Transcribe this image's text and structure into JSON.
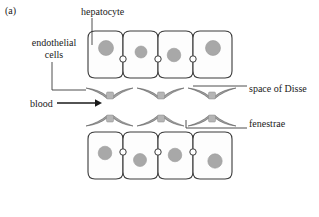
{
  "figure": {
    "panel_label": "(a)",
    "domain": "liver sinusoid cross-section diagram"
  },
  "labels": {
    "hepatocyte": "hepatocyte",
    "endothelial_cells": "endothelial\ncells",
    "endothelial_cells_line1": "endothelial",
    "endothelial_cells_line2": "cells",
    "blood": "blood",
    "space_of_disse": "space of Disse",
    "fenestrae": "fenestrae"
  },
  "colors": {
    "stroke": "#3a3a3a",
    "nucleus_fill": "#a8a8a8",
    "nucleus_stroke": "#8f8f8f",
    "cell_fill": "#fdfdfd",
    "canaliculus_fill": "#ffffff",
    "endothelium_fill": "#cfcfcf",
    "text": "#1a1a1a",
    "background": "#ffffff"
  },
  "structures": {
    "hepatocyte_rows": [
      {
        "name": "upper-hepatocyte-row",
        "y": 31,
        "height": 47,
        "cells": [
          {
            "x": 88,
            "width": 35,
            "nucleus_cx": 106,
            "nucleus_cy": 48,
            "nucleus_r": 7.5
          },
          {
            "x": 123,
            "width": 35,
            "nucleus_cx": 141,
            "nucleus_cy": 52,
            "nucleus_r": 6.0
          },
          {
            "x": 158,
            "width": 35,
            "nucleus_cx": 174,
            "nucleus_cy": 55,
            "nucleus_r": 6.8
          },
          {
            "x": 193,
            "width": 39,
            "nucleus_cx": 213,
            "nucleus_cy": 48,
            "nucleus_r": 7.5
          }
        ],
        "canaliculi": [
          {
            "cx": 123,
            "cy": 59,
            "r": 3.2
          },
          {
            "cx": 158,
            "cy": 59,
            "r": 3.2
          },
          {
            "cx": 193,
            "cy": 59,
            "r": 3.2
          }
        ]
      },
      {
        "name": "lower-hepatocyte-row",
        "y": 132,
        "height": 47,
        "cells": [
          {
            "x": 88,
            "width": 35,
            "nucleus_cx": 105,
            "nucleus_cy": 153,
            "nucleus_r": 6.8
          },
          {
            "x": 123,
            "width": 35,
            "nucleus_cx": 140,
            "nucleus_cy": 160,
            "nucleus_r": 6.5
          },
          {
            "x": 158,
            "width": 35,
            "nucleus_cx": 175,
            "nucleus_cy": 155,
            "nucleus_r": 6.8
          },
          {
            "x": 193,
            "width": 39,
            "nucleus_cx": 215,
            "nucleus_cy": 161,
            "nucleus_r": 7.2
          }
        ],
        "canaliculi": [
          {
            "cx": 123,
            "cy": 152,
            "r": 3.2
          },
          {
            "cx": 158,
            "cy": 152,
            "r": 3.2
          },
          {
            "cx": 193,
            "cy": 152,
            "r": 3.2
          }
        ]
      }
    ],
    "endothelial_rows": [
      {
        "name": "upper-endothelial-row",
        "orientation": "concave-down",
        "cells": [
          {
            "left": 86,
            "right": 133,
            "apex_x": 110,
            "base_y": 88,
            "apex_y": 97
          },
          {
            "left": 137,
            "right": 184,
            "apex_x": 161,
            "base_y": 88,
            "apex_y": 97
          },
          {
            "left": 188,
            "right": 236,
            "apex_x": 212,
            "base_y": 88,
            "apex_y": 97
          }
        ]
      },
      {
        "name": "lower-endothelial-row",
        "orientation": "convex-up",
        "cells": [
          {
            "left": 86,
            "right": 133,
            "apex_x": 110,
            "base_y": 126,
            "apex_y": 117
          },
          {
            "left": 137,
            "right": 184,
            "apex_x": 161,
            "base_y": 126,
            "apex_y": 117
          },
          {
            "left": 188,
            "right": 236,
            "apex_x": 212,
            "base_y": 126,
            "apex_y": 117
          }
        ]
      }
    ],
    "leaders": {
      "hepatocyte": {
        "x": 92,
        "y1": 18,
        "y2": 42
      },
      "endothelial": {
        "x": 52,
        "y1": 62,
        "y2": 90,
        "x2": 86
      },
      "blood_arrow": {
        "x1": 57,
        "x2": 98,
        "y": 103
      },
      "space_of_disse": {
        "x1": 193,
        "x2": 247,
        "y": 86
      },
      "fenestrae": {
        "x_elbow": 186,
        "y_top": 120,
        "y_line": 128,
        "x_end": 247
      }
    }
  }
}
